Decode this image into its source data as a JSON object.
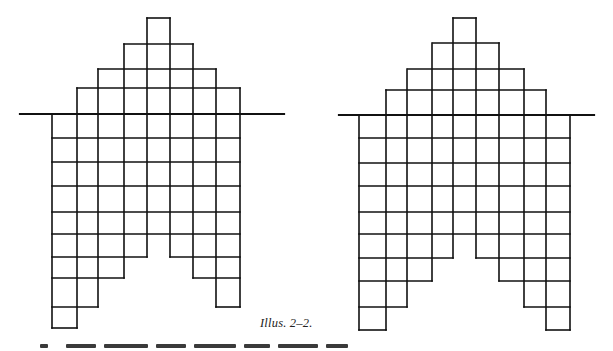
{
  "caption": "Illus. 2–2.",
  "colors": {
    "ink": "#111111",
    "background": "#ffffff"
  },
  "figures": [
    {
      "name": "left-arch-grid",
      "baseline": {
        "y": 114,
        "x1": 20,
        "x2": 284
      },
      "columns_x": [
        52,
        77,
        98,
        124,
        147,
        170,
        193,
        216,
        240
      ],
      "above_rows": [
        {
          "y": 18,
          "x1": 147,
          "x2": 170
        },
        {
          "y": 44,
          "x1": 124,
          "x2": 193
        },
        {
          "y": 69,
          "x1": 98,
          "x2": 216
        },
        {
          "y": 88,
          "x1": 77,
          "x2": 240
        }
      ],
      "column_tops": [
        114,
        88,
        69,
        44,
        18,
        18,
        44,
        69,
        88
      ],
      "below_rows_y": [
        138,
        162,
        186,
        212,
        234,
        257,
        278,
        307,
        328
      ],
      "column_bottoms": [
        328,
        307,
        278,
        257,
        234,
        257,
        278,
        307
      ]
    },
    {
      "name": "right-arch-grid",
      "baseline": {
        "y": 115,
        "x1": 339,
        "x2": 594
      },
      "columns_x": [
        359,
        386,
        407,
        432,
        453,
        476,
        499,
        524,
        546,
        570
      ],
      "above_rows": [
        {
          "y": 18,
          "x1": 453,
          "x2": 476
        },
        {
          "y": 43,
          "x1": 433,
          "x2": 499
        },
        {
          "y": 69,
          "x1": 408,
          "x2": 524
        },
        {
          "y": 90,
          "x1": 386,
          "x2": 546
        }
      ],
      "column_tops": [
        115,
        90,
        69,
        43,
        18,
        18,
        43,
        69,
        90,
        115
      ],
      "below_rows_y": [
        138,
        163,
        186,
        212,
        234,
        258,
        281,
        307,
        330
      ],
      "column_bottoms": [
        330,
        307,
        281,
        258,
        234,
        258,
        281,
        307,
        330
      ]
    }
  ]
}
